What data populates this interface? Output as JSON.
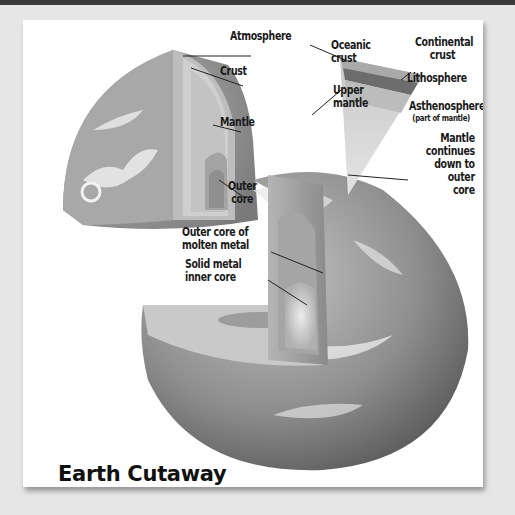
{
  "diagram": {
    "title": "Earth Cutaway",
    "colors": {
      "background": "#e6e6e6",
      "card": "#ffffff",
      "top_bar": "#3a3a3a",
      "label_text": "#1a1a1a",
      "globe_mid": "#9a9a9a",
      "globe_dark": "#5a5a5a",
      "cloud": "#f2f2f2"
    },
    "labels": {
      "atmosphere": "Atmosphere",
      "crust": "Crust",
      "mantle": "Mantle",
      "outer_core_line1": "Outer",
      "outer_core_line2": "core",
      "oceanic_crust_line1": "Oceanic",
      "oceanic_crust_line2": "crust",
      "continental_crust_line1": "Continental",
      "continental_crust_line2": "crust",
      "lithosphere": "Lithosphere",
      "upper_mantle_line1": "Upper",
      "upper_mantle_line2": "mantle",
      "asthenosphere": "Asthenosphere",
      "asthenosphere_note": "(part of mantle)",
      "mantle_continues_line1": "Mantle",
      "mantle_continues_line2": "continues",
      "mantle_continues_line3": "down to",
      "mantle_continues_line4": "outer",
      "mantle_continues_line5": "core",
      "outer_core_molten_line1": "Outer core of",
      "outer_core_molten_line2": "molten metal",
      "inner_core_line1": "Solid metal",
      "inner_core_line2": "inner core"
    }
  }
}
